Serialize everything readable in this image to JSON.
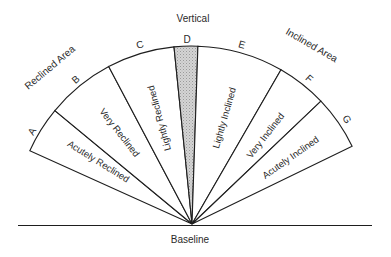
{
  "title": "Vertical",
  "baseline_label": "Baseline",
  "areas": {
    "reclined": "Reclined Area",
    "inclined": "Inclined Area"
  },
  "markers": [
    "A",
    "B",
    "C",
    "D",
    "E",
    "F",
    "G"
  ],
  "segments": [
    {
      "label": "Acutely Reclined",
      "from": "A",
      "to": "B"
    },
    {
      "label": "Very Reclined",
      "from": "B",
      "to": "C"
    },
    {
      "label": "Lightly Reclined",
      "from": "C",
      "to": "D"
    },
    {
      "label": "",
      "from": "D",
      "to": "D",
      "shaded": true
    },
    {
      "label": "Lightly Inclined",
      "from": "D",
      "to": "E"
    },
    {
      "label": "Very Inclined",
      "from": "E",
      "to": "F"
    },
    {
      "label": "Acutely Inclined",
      "from": "F",
      "to": "G"
    }
  ],
  "colors": {
    "line": "#1e1e1e",
    "vertical_fill": "#c8c8c8",
    "background": "#ffffff"
  }
}
